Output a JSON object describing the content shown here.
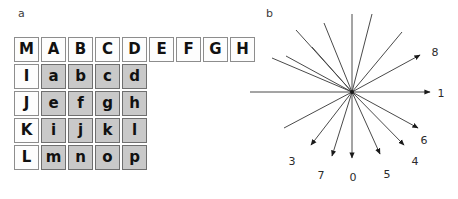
{
  "figure": {
    "panels": [
      {
        "id": "a",
        "label": "a"
      },
      {
        "id": "b",
        "label": "b"
      }
    ]
  },
  "panel_a": {
    "name": "letter-grid",
    "colors": {
      "white_cell": "#fdfdfd",
      "gray_cell": "#c9c9c9",
      "white_border": "#8d8d8d",
      "gray_border": "#6f6f6f",
      "text": "#111111"
    },
    "rows": [
      {
        "cells": [
          {
            "text": "M",
            "fill": "white"
          },
          {
            "text": "A",
            "fill": "white"
          },
          {
            "text": "B",
            "fill": "white"
          },
          {
            "text": "C",
            "fill": "white"
          },
          {
            "text": "D",
            "fill": "white"
          },
          {
            "text": "E",
            "fill": "white"
          },
          {
            "text": "F",
            "fill": "white"
          },
          {
            "text": "G",
            "fill": "white"
          },
          {
            "text": "H",
            "fill": "white"
          }
        ]
      },
      {
        "cells": [
          {
            "text": "I",
            "fill": "white"
          },
          {
            "text": "a",
            "fill": "gray"
          },
          {
            "text": "b",
            "fill": "gray"
          },
          {
            "text": "c",
            "fill": "gray"
          },
          {
            "text": "d",
            "fill": "gray"
          }
        ]
      },
      {
        "cells": [
          {
            "text": "J",
            "fill": "white"
          },
          {
            "text": "e",
            "fill": "gray"
          },
          {
            "text": "f",
            "fill": "gray"
          },
          {
            "text": "g",
            "fill": "gray"
          },
          {
            "text": "h",
            "fill": "gray"
          }
        ]
      },
      {
        "cells": [
          {
            "text": "K",
            "fill": "white"
          },
          {
            "text": "i",
            "fill": "gray"
          },
          {
            "text": "j",
            "fill": "gray"
          },
          {
            "text": "k",
            "fill": "gray"
          },
          {
            "text": "l",
            "fill": "gray"
          }
        ]
      },
      {
        "cells": [
          {
            "text": "L",
            "fill": "white"
          },
          {
            "text": "m",
            "fill": "gray"
          },
          {
            "text": "n",
            "fill": "gray"
          },
          {
            "text": "o",
            "fill": "gray"
          },
          {
            "text": "p",
            "fill": "gray"
          }
        ]
      }
    ]
  },
  "panel_b": {
    "name": "radial-arrow-diagram",
    "center": {
      "x": 120,
      "y": 92
    },
    "line_color": "#4a4a4a",
    "arrow_color": "#1a1a1a",
    "label_color": "#2b2b2b",
    "arrows": [
      {
        "label": "0",
        "angle_deg": -90,
        "tip": {
          "x": 120,
          "y": 158
        },
        "tail": {
          "x": 120,
          "y": 14
        },
        "label_pos": {
          "x": 121,
          "y": 177
        }
      },
      {
        "label": "1",
        "angle_deg": 0,
        "tip": {
          "x": 198,
          "y": 92
        },
        "tail": {
          "x": 18,
          "y": 92
        },
        "label_pos": {
          "x": 209,
          "y": 93
        }
      },
      {
        "label": "3",
        "angle_deg": -128,
        "tip": {
          "x": 79,
          "y": 145
        },
        "tail": {
          "x": 170,
          "y": 32
        },
        "label_pos": {
          "x": 60,
          "y": 161
        }
      },
      {
        "label": "4",
        "angle_deg": -55,
        "tip": {
          "x": 172,
          "y": 145
        },
        "tail": {
          "x": 80,
          "y": 47
        },
        "label_pos": {
          "x": 183,
          "y": 161
        }
      },
      {
        "label": "5",
        "angle_deg": -72,
        "tip": {
          "x": 148,
          "y": 154
        },
        "tail": {
          "x": 92,
          "y": 23
        },
        "label_pos": {
          "x": 155,
          "y": 174
        }
      },
      {
        "label": "6",
        "angle_deg": -33,
        "tip": {
          "x": 186,
          "y": 128
        },
        "tail": {
          "x": 54,
          "y": 56
        },
        "label_pos": {
          "x": 192,
          "y": 140
        }
      },
      {
        "label": "7",
        "angle_deg": -105,
        "tip": {
          "x": 100,
          "y": 156
        },
        "tail": {
          "x": 140,
          "y": 14
        },
        "label_pos": {
          "x": 89,
          "y": 175
        }
      },
      {
        "label": "8",
        "angle_deg": 30,
        "tip": {
          "x": 188,
          "y": 55
        },
        "tail": {
          "x": 52,
          "y": 128
        },
        "label_pos": {
          "x": 203,
          "y": 52
        }
      }
    ],
    "extra_lines": [
      {
        "from": {
          "x": 120,
          "y": 92
        },
        "to": {
          "x": 40,
          "y": 58
        }
      },
      {
        "from": {
          "x": 120,
          "y": 92
        },
        "to": {
          "x": 64,
          "y": 30
        }
      }
    ]
  }
}
